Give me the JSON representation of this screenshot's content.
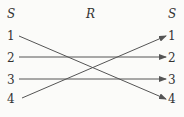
{
  "diagram": {
    "left_header": "S",
    "middle_header": "R",
    "right_header": "S",
    "left_nodes": [
      "1",
      "2",
      "3",
      "4"
    ],
    "right_nodes": [
      "1",
      "2",
      "3",
      "4"
    ],
    "edges": [
      {
        "from": "1",
        "to": "4"
      },
      {
        "from": "2",
        "to": "2"
      },
      {
        "from": "3",
        "to": "3"
      },
      {
        "from": "4",
        "to": "1"
      }
    ],
    "colors": {
      "line": "#555555",
      "text": "#333333",
      "background": "#fbfbf9"
    }
  }
}
